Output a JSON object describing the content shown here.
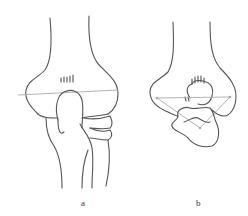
{
  "figure": {
    "panels": [
      {
        "id": "a",
        "label": "a",
        "description": "Anterior view of elbow joint with horizontal reference line"
      },
      {
        "id": "b",
        "label": "b",
        "description": "Distal view of humerus with triangle reference lines"
      }
    ],
    "colors": {
      "outline": "#555555",
      "guide": "#aaaaaa",
      "background": "#ffffff"
    }
  }
}
